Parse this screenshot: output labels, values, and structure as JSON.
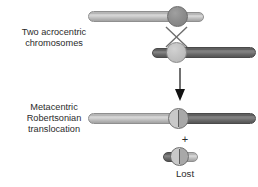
{
  "figure": {
    "title_alt": "Robertsonian translocation diagram",
    "background": "#ffffff"
  },
  "labels": {
    "acrocentric": "Two acrocentric\nchromosomes",
    "metacentric": "Metacentric\nRobertsonian\ntranslocation",
    "plus": "+",
    "lost": "Lost"
  },
  "colors": {
    "light_arm": "#c6c6c6",
    "dark_arm": "#6e6e6e",
    "centromere_dark": "#8e8e8e",
    "centromere_light": "#c3c3c3",
    "outline": "#6a6a6a",
    "text": "#2b2b2b",
    "arrow": "#111111"
  },
  "elements": {
    "chromosome_1": {
      "name": "acrocentric-chromosome-1",
      "long_arm_shade": "light",
      "short_arm_shade": "light",
      "centromere_shade": "dark"
    },
    "chromosome_2": {
      "name": "acrocentric-chromosome-2",
      "long_arm_shade": "dark",
      "short_arm_shade": "dark",
      "centromere_shade": "light"
    },
    "crossover": {
      "name": "crossover-x-mark"
    },
    "arrow": {
      "name": "downward-arrow"
    },
    "product": {
      "name": "metacentric-product-chromosome",
      "left_arm_shade": "light",
      "right_arm_shade": "dark",
      "centromere_shade": "split"
    },
    "fragment": {
      "name": "lost-fragment-chromosome",
      "left_arm_shade": "dark",
      "right_arm_shade": "light",
      "centromere_shade": "split"
    }
  }
}
